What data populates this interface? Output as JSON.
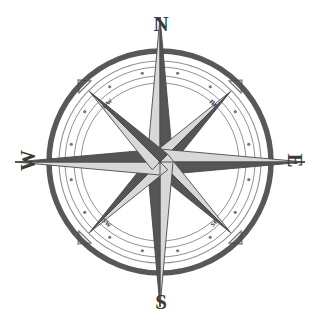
{
  "figure": {
    "name": "compass-rose",
    "background_color": "#ffffff",
    "ink_color": "#4a4a4a",
    "dark_face_color": "#555555",
    "light_face_color": "#d8d8d8"
  },
  "labels": {
    "north": "N",
    "south": "S",
    "west": "W",
    "east": "E",
    "northwest": "nw",
    "northeast": "ne",
    "southwest": "sw",
    "southeast": "se"
  },
  "chart_data": {
    "type": "scatter",
    "xlabel": "",
    "ylabel": "",
    "center": [
      160,
      162
    ],
    "grid": false,
    "legend": null,
    "rings": [
      {
        "name": "outer-thick-ring",
        "radius": 111,
        "stroke_width": 5.5
      },
      {
        "name": "inner-thin-ring-1",
        "radius": 101,
        "stroke_width": 1.1
      },
      {
        "name": "degree-band-outer",
        "radius": 95,
        "stroke_width": 1.0
      },
      {
        "name": "degree-band-inner",
        "radius": 86,
        "stroke_width": 1.0
      },
      {
        "name": "inner-thin-ring-2",
        "radius": 79,
        "stroke_width": 1.0
      }
    ],
    "degree_dots": {
      "count": 16,
      "radius": 90.5,
      "dot_radius": 1.6,
      "start_angle_deg": 11.25
    },
    "points": [
      {
        "name": "N",
        "angle_deg": 0,
        "length": 145,
        "half_width": 13,
        "label": "N",
        "major": true
      },
      {
        "name": "NE",
        "angle_deg": 45,
        "length": 100,
        "half_width": 11,
        "label": "ne",
        "major": false
      },
      {
        "name": "E",
        "angle_deg": 90,
        "length": 145,
        "half_width": 13,
        "label": "E",
        "major": true
      },
      {
        "name": "SE",
        "angle_deg": 135,
        "length": 100,
        "half_width": 11,
        "label": "se",
        "major": false
      },
      {
        "name": "S",
        "angle_deg": 180,
        "length": 145,
        "half_width": 13,
        "label": "S",
        "major": true
      },
      {
        "name": "SW",
        "angle_deg": 225,
        "length": 100,
        "half_width": 11,
        "label": "sw",
        "major": false
      },
      {
        "name": "W",
        "angle_deg": 270,
        "length": 145,
        "half_width": 13,
        "label": "W",
        "major": true
      },
      {
        "name": "NW",
        "angle_deg": 315,
        "length": 100,
        "half_width": 11,
        "label": "nw",
        "major": false
      }
    ],
    "ordinal_markers": {
      "angles_deg": [
        45,
        135,
        225,
        315
      ],
      "radius": 111,
      "size": 9
    }
  }
}
